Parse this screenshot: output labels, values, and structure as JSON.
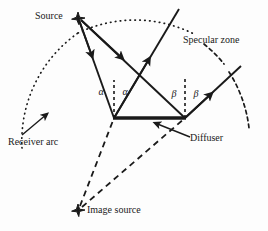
{
  "figure": {
    "background_color": "#fdfdfd",
    "ink_color": "#1a1a1a"
  },
  "labels": {
    "source": "Source",
    "specular_zone": "Specular zone",
    "receiver_arc": "Receiver arc",
    "diffuser": "Diffuser",
    "image_source": "Image source",
    "alpha_left": "α",
    "alpha_right": "α",
    "beta_left": "β",
    "beta_right": "β"
  },
  "markers": {
    "source_marker": "star",
    "image_source_marker": "star"
  },
  "geometry": {
    "source_point": [
      78,
      18
    ],
    "image_source_point": [
      78,
      210
    ],
    "diffuser_left": [
      114,
      118
    ],
    "diffuser_right": [
      185,
      118
    ],
    "incident_ray_left_end": [
      114,
      118
    ],
    "incident_ray_right_end": [
      185,
      118
    ],
    "reflected_ray_left_end": [
      179,
      9
    ],
    "reflected_ray_right_end": [
      241,
      66
    ],
    "normal_left": [
      114,
      80
    ],
    "normal_right": [
      185,
      76
    ],
    "receiver_arc_center": [
      150,
      150
    ],
    "receiver_arc_radius": 130,
    "specular_arc_segments": 2
  },
  "styles": {
    "ray_line": "solid",
    "image_source_line": "dashed",
    "normal_line": "dashed",
    "receiver_arc_line": "dotted",
    "diffuser_line": "solid-thick"
  }
}
